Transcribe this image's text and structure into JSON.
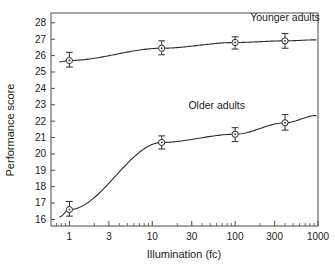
{
  "chart_data": {
    "type": "line",
    "title": "",
    "xlabel": "Illumination (fc)",
    "ylabel": "Performance score",
    "xscale": "log",
    "xlim": [
      0.6,
      1000
    ],
    "ylim": [
      15.6,
      28.6
    ],
    "xticks": [
      1,
      3,
      10,
      30,
      100,
      300,
      1000
    ],
    "xtick_labels": [
      "1",
      "3",
      "10",
      "30",
      "100",
      "300",
      "1000"
    ],
    "yticks": [
      16,
      17,
      18,
      19,
      20,
      21,
      22,
      23,
      24,
      25,
      26,
      27,
      28
    ],
    "ytick_labels": [
      "16",
      "17",
      "18",
      "19",
      "20",
      "21",
      "22",
      "23",
      "24",
      "25",
      "26",
      "27",
      "28"
    ],
    "grid": false,
    "legend_position": "inline-annotations",
    "x": [
      1,
      13,
      100,
      400
    ],
    "series": [
      {
        "name": "Younger adults",
        "values": [
          25.7,
          26.45,
          26.8,
          26.9
        ],
        "err_low": [
          25.3,
          26.05,
          26.4,
          26.45
        ],
        "err_high": [
          26.2,
          26.9,
          27.15,
          27.35
        ],
        "label_x": 400,
        "label_y": 28.1
      },
      {
        "name": "Older adults",
        "values": [
          16.6,
          20.7,
          21.2,
          21.9
        ],
        "err_low": [
          16.2,
          20.3,
          20.75,
          21.45
        ],
        "err_high": [
          17.1,
          21.1,
          21.6,
          22.4
        ],
        "label_x": 60,
        "label_y": 22.75
      }
    ],
    "annotations": [
      {
        "text": "Younger adults",
        "x": 400,
        "y": 28.1
      },
      {
        "text": "Older adults",
        "x": 60,
        "y": 22.75
      }
    ]
  },
  "colors": {
    "background": "#ffffff",
    "axis": "#4a4a4a",
    "data": "#2b2b2b",
    "text": "#1a1a1a"
  }
}
